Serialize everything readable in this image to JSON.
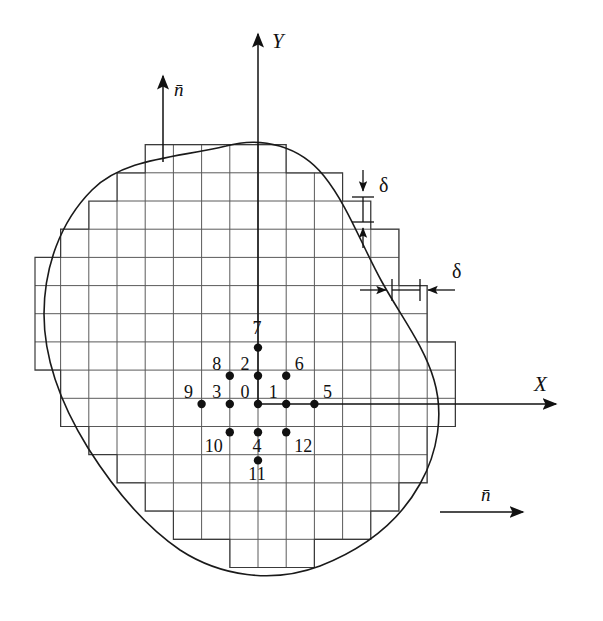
{
  "figure": {
    "background_color": "#ffffff",
    "line_color": "#111111",
    "grid_color": "#5a5a5a",
    "node_color": "#111111"
  },
  "axes": {
    "x": {
      "label": "X",
      "origin_px": [
        258,
        404
      ],
      "end_px": [
        560,
        404
      ],
      "label_pos_px": [
        538,
        390
      ]
    },
    "y": {
      "label": "Y",
      "origin_px": [
        258,
        404
      ],
      "end_px": [
        258,
        30
      ],
      "label_pos_px": [
        272,
        48
      ]
    }
  },
  "normals": [
    {
      "label": "n̄",
      "name": "normal-vector-top",
      "start_px": [
        163,
        160
      ],
      "end_px": [
        163,
        72
      ],
      "label_pos_px": [
        174,
        92
      ]
    },
    {
      "label": "n̄",
      "name": "normal-vector-right",
      "start_px": [
        440,
        512
      ],
      "end_px": [
        527,
        512
      ],
      "label_pos_px": [
        487,
        497
      ]
    }
  ],
  "spacing_markers": {
    "vertical": {
      "symbol": "δ",
      "label_pos_px": [
        386,
        185
      ],
      "line_x_px": 363,
      "top_px": 170,
      "bottom_px": 248,
      "tick_upper_px": 195,
      "tick_lower_px": 222,
      "tick_half_width_px": 11
    },
    "horizontal": {
      "symbol": "δ",
      "label_pos_px": [
        459,
        271
      ],
      "line_y_px": 290,
      "left_px": 360,
      "right_px": 455,
      "tick_left_px": 392,
      "tick_right_px": 420,
      "tick_half_height_px": 11
    }
  },
  "grid": {
    "spacing_px": 28.2,
    "origin_px": [
      258,
      404
    ],
    "description": "Uniform square mesh of spacing delta overlaid on the domain, clipped to a staircase approximation of the smooth boundary."
  },
  "stencil": {
    "description": "13-point finite difference stencil centred on node 0",
    "center_index": 0,
    "nodes": [
      {
        "id": "0",
        "col": 0,
        "row": 0
      },
      {
        "id": "1",
        "col": 1,
        "row": 0
      },
      {
        "id": "2",
        "col": 0,
        "row": 1
      },
      {
        "id": "3",
        "col": -1,
        "row": 0
      },
      {
        "id": "4",
        "col": 0,
        "row": -1
      },
      {
        "id": "5",
        "col": 2,
        "row": 0
      },
      {
        "id": "6",
        "col": 1,
        "row": 1
      },
      {
        "id": "7",
        "col": 0,
        "row": 2
      },
      {
        "id": "8",
        "col": -1,
        "row": 1
      },
      {
        "id": "9",
        "col": -2,
        "row": 0
      },
      {
        "id": "10",
        "col": -1,
        "row": -1
      },
      {
        "id": "11",
        "col": 0,
        "row": -2
      },
      {
        "id": "12",
        "col": 1,
        "row": -1
      }
    ],
    "label_offsets": {
      "0": [
        -13,
        -6
      ],
      "1": [
        -13,
        -6
      ],
      "2": [
        -13,
        -6
      ],
      "3": [
        -13,
        -6
      ],
      "4": [
        -1,
        20
      ],
      "5": [
        13,
        -6
      ],
      "6": [
        13,
        -6
      ],
      "7": [
        -1,
        -14
      ],
      "8": [
        -13,
        -6
      ],
      "9": [
        -13,
        -6
      ],
      "10": [
        -16,
        20
      ],
      "11": [
        -1,
        20
      ],
      "12": [
        17,
        20
      ]
    }
  },
  "boundary": {
    "name": "domain-boundary-curve",
    "description": "Smooth closed curve bounding the irregular two-dimensional region."
  }
}
